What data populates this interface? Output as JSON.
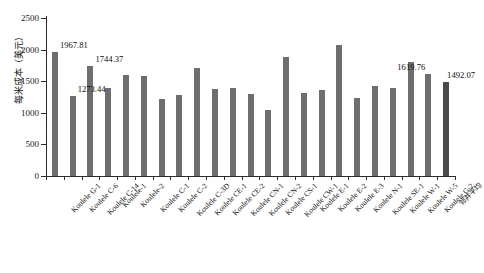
{
  "figure": {
    "top_strip_text": "",
    "caption": ""
  },
  "chart_data": {
    "type": "bar",
    "title": "",
    "xlabel": "",
    "ylabel": "每米成本（美元）",
    "ylim": [
      0,
      2500
    ],
    "yticks": [
      0,
      500,
      1000,
      1500,
      2000,
      2500
    ],
    "ytick_labels": [
      "0",
      "500",
      "1000",
      "1500",
      "2000",
      "2500"
    ],
    "grid": false,
    "legend": null,
    "bar_color": "#6e6e6e",
    "highlight_color": "#4a4a4a",
    "categories": [
      "Koulele G-1",
      "Koulele C-6",
      "Koulele C-14",
      "Koulele-1",
      "Koulele-2",
      "Koulele C-1",
      "Koulele C-2",
      "Koulele C-3D",
      "Koulele CE-1",
      "Koulele CE-2",
      "Koulele CN-1",
      "Koulele CN-2",
      "Koulele CS-1",
      "Koulele CW-1",
      "Koulele E-1",
      "Koulele E-2",
      "Koulele E-3",
      "Koulele N-1",
      "Koulele SE-1",
      "Koulele W-1",
      "Koulele W-5",
      "Koulele G-2",
      "邻井平均"
    ],
    "values": [
      1967.81,
      1273.44,
      1744.37,
      1390,
      1605,
      1585,
      1215,
      1285,
      1710,
      1375,
      1400,
      1290,
      1040,
      1880,
      1320,
      1365,
      2080,
      1235,
      1420,
      1385,
      1800,
      1619.76,
      1492.07
    ],
    "labeled_points": [
      {
        "index": 0,
        "value": "1967.81"
      },
      {
        "index": 1,
        "value": "1273.44"
      },
      {
        "index": 2,
        "value": "1744.37"
      },
      {
        "index": 21,
        "value": "1619.76"
      },
      {
        "index": 22,
        "value": "1492.07"
      }
    ]
  }
}
